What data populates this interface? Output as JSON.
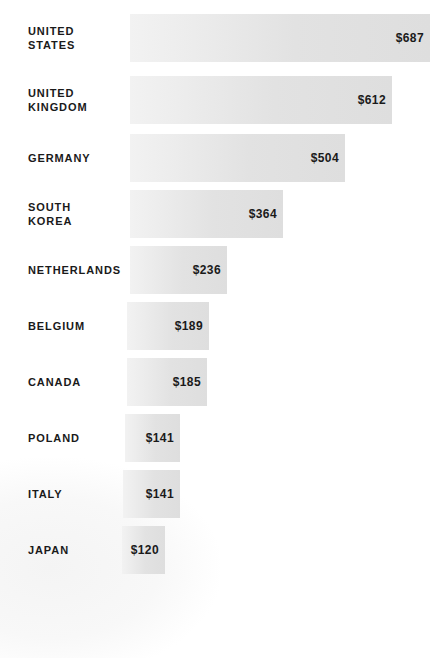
{
  "chart_data": {
    "type": "bar",
    "orientation": "horizontal",
    "title": "",
    "subtitle": "",
    "xlabel": "",
    "ylabel": "",
    "grid": false,
    "legend": null,
    "value_prefix": "$",
    "xlim": [
      0,
      687
    ],
    "categories": [
      "UNITED\nSTATES",
      "UNITED\nKINGDOM",
      "GERMANY",
      "SOUTH\nKOREA",
      "NETHERLANDS",
      "BELGIUM",
      "CANADA",
      "POLAND",
      "ITALY",
      "JAPAN"
    ],
    "values": [
      687,
      612,
      504,
      364,
      236,
      189,
      185,
      141,
      141,
      120
    ],
    "value_labels": [
      "$687",
      "$612",
      "$504",
      "$364",
      "$236",
      "$189",
      "$185",
      "$141",
      "$141",
      "$120"
    ],
    "bars": [
      {
        "label": "UNITED\nSTATES",
        "value": 687,
        "value_label": "$687",
        "top": 14,
        "height": 48,
        "bar_left": 130,
        "bar_width": 300
      },
      {
        "label": "UNITED\nKINGDOM",
        "value": 612,
        "value_label": "$612",
        "top": 76,
        "height": 48,
        "bar_left": 130,
        "bar_width": 262
      },
      {
        "label": "GERMANY",
        "value": 504,
        "value_label": "$504",
        "top": 134,
        "height": 48,
        "bar_left": 130,
        "bar_width": 215
      },
      {
        "label": "SOUTH\nKOREA",
        "value": 364,
        "value_label": "$364",
        "top": 190,
        "height": 48,
        "bar_left": 130,
        "bar_width": 153
      },
      {
        "label": "NETHERLANDS",
        "value": 236,
        "value_label": "$236",
        "top": 246,
        "height": 48,
        "bar_left": 130,
        "bar_width": 97
      },
      {
        "label": "BELGIUM",
        "value": 189,
        "value_label": "$189",
        "top": 302,
        "height": 48,
        "bar_left": 127,
        "bar_width": 82
      },
      {
        "label": "CANADA",
        "value": 185,
        "value_label": "$185",
        "top": 358,
        "height": 48,
        "bar_left": 127,
        "bar_width": 80
      },
      {
        "label": "POLAND",
        "value": 141,
        "value_label": "$141",
        "top": 414,
        "height": 48,
        "bar_left": 125,
        "bar_width": 55
      },
      {
        "label": "ITALY",
        "value": 141,
        "value_label": "$141",
        "top": 470,
        "height": 48,
        "bar_left": 123,
        "bar_width": 57
      },
      {
        "label": "JAPAN",
        "value": 120,
        "value_label": "$120",
        "top": 526,
        "height": 48,
        "bar_left": 122,
        "bar_width": 43
      }
    ],
    "colors": {
      "bar_light": "#f2f2f2",
      "bar_dark": "#dedede",
      "text": "#1a1a1a",
      "background": "#ffffff"
    }
  }
}
